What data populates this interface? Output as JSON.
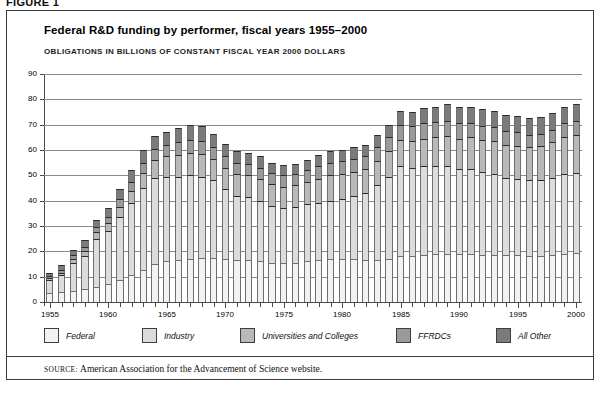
{
  "figure": {
    "label": "FIGURE 1"
  },
  "header": {
    "title": "Federal R&D funding by performer, fiscal years 1955–2000",
    "subtitle": "OBLIGATIONS IN BILLIONS OF CONSTANT FISCAL YEAR 2000 DOLLARS"
  },
  "source": {
    "prefix": "SOURCE:",
    "text": "American Association for the Advancement of Science website."
  },
  "legend": {
    "position": "bottom",
    "items": [
      {
        "label": "Federal",
        "color": "#f2f2f0"
      },
      {
        "label": "Industry",
        "color": "#dcdcda"
      },
      {
        "label": "Universities and Colleges",
        "color": "#b9b9b7"
      },
      {
        "label": "FFRDCs",
        "color": "#9a9a98"
      },
      {
        "label": "All Other",
        "color": "#7b7b79"
      }
    ]
  },
  "chart_data": {
    "type": "bar",
    "stacked": true,
    "title": "Federal R&D funding by performer, fiscal years 1955–2000",
    "subtitle": "OBLIGATIONS IN BILLIONS OF CONSTANT FISCAL YEAR 2000 DOLLARS",
    "xlabel": "",
    "ylabel": "",
    "ylim": [
      0,
      90
    ],
    "ytick_step": 10,
    "yticks": [
      0,
      10,
      20,
      30,
      40,
      50,
      60,
      70,
      80,
      90
    ],
    "grid": true,
    "xlim": [
      1955,
      2000
    ],
    "x_tick_labels": [
      1955,
      1960,
      1965,
      1970,
      1975,
      1980,
      1985,
      1990,
      1995,
      2000
    ],
    "categories": [
      1955,
      1956,
      1957,
      1958,
      1959,
      1960,
      1961,
      1962,
      1963,
      1964,
      1965,
      1966,
      1967,
      1968,
      1969,
      1970,
      1971,
      1972,
      1973,
      1974,
      1975,
      1976,
      1977,
      1978,
      1979,
      1980,
      1981,
      1982,
      1983,
      1984,
      1985,
      1986,
      1987,
      1988,
      1989,
      1990,
      1991,
      1992,
      1993,
      1994,
      1995,
      1996,
      1997,
      1998,
      1999,
      2000
    ],
    "series": [
      {
        "name": "Federal",
        "color": "#f2f2f0",
        "values": [
          3.5,
          4.0,
          4.5,
          5.0,
          6.0,
          7.0,
          8.5,
          10.5,
          12.5,
          15.0,
          16.0,
          16.5,
          17.0,
          17.5,
          17.5,
          17.0,
          16.5,
          16.5,
          16.0,
          15.5,
          15.5,
          15.5,
          16.0,
          16.5,
          17.0,
          17.0,
          17.0,
          16.5,
          16.5,
          17.0,
          18.0,
          18.0,
          18.5,
          19.0,
          19.0,
          19.0,
          19.0,
          18.5,
          18.5,
          18.5,
          18.5,
          18.0,
          18.0,
          18.5,
          19.0,
          19.5
        ]
      },
      {
        "name": "Industry",
        "color": "#dcdcda",
        "values": [
          5.0,
          6.5,
          11.0,
          13.0,
          19.0,
          21.0,
          25.0,
          28.5,
          32.5,
          34.0,
          33.5,
          33.0,
          33.0,
          32.0,
          30.5,
          27.5,
          25.5,
          25.0,
          24.0,
          22.5,
          21.5,
          22.0,
          22.5,
          22.5,
          23.0,
          23.5,
          25.0,
          26.5,
          29.5,
          32.5,
          35.5,
          35.0,
          35.0,
          34.5,
          34.5,
          33.5,
          33.5,
          33.0,
          32.0,
          30.5,
          30.0,
          30.0,
          30.0,
          30.5,
          31.5,
          31.5
        ]
      },
      {
        "name": "Universities and Colleges",
        "color": "#b9b9b7",
        "values": [
          0.8,
          1.0,
          1.5,
          2.0,
          2.5,
          3.0,
          4.0,
          5.0,
          6.0,
          7.0,
          8.0,
          8.5,
          9.0,
          9.0,
          8.5,
          8.5,
          8.5,
          8.5,
          8.5,
          8.5,
          8.5,
          8.5,
          9.0,
          9.5,
          10.0,
          10.0,
          9.5,
          9.5,
          9.5,
          10.0,
          10.5,
          10.5,
          11.0,
          11.5,
          12.0,
          12.0,
          12.5,
          12.5,
          13.0,
          13.0,
          13.0,
          13.0,
          13.5,
          14.0,
          14.5,
          15.0
        ]
      },
      {
        "name": "FFRDCs",
        "color": "#9a9a98",
        "values": [
          1.0,
          1.2,
          1.5,
          1.8,
          2.0,
          2.5,
          3.0,
          3.5,
          4.0,
          4.5,
          4.5,
          5.0,
          5.0,
          5.0,
          4.5,
          4.5,
          4.5,
          4.5,
          4.5,
          4.5,
          4.5,
          4.5,
          4.5,
          5.0,
          5.0,
          5.0,
          5.0,
          5.0,
          5.5,
          5.5,
          6.0,
          6.0,
          6.0,
          6.0,
          6.0,
          6.0,
          5.5,
          5.5,
          5.5,
          5.5,
          5.5,
          5.0,
          5.0,
          5.0,
          5.5,
          5.5
        ]
      },
      {
        "name": "All Other",
        "color": "#7b7b79",
        "values": [
          1.2,
          1.8,
          2.0,
          2.5,
          3.0,
          3.5,
          4.0,
          4.5,
          5.0,
          5.0,
          5.0,
          5.5,
          6.0,
          6.0,
          5.5,
          5.0,
          4.5,
          4.5,
          4.5,
          4.0,
          4.0,
          4.0,
          4.0,
          4.5,
          4.5,
          4.5,
          4.5,
          4.5,
          5.0,
          5.0,
          5.5,
          5.5,
          6.0,
          6.0,
          6.5,
          6.5,
          6.5,
          6.5,
          6.5,
          6.5,
          6.5,
          6.5,
          6.5,
          6.5,
          6.5,
          6.5
        ]
      }
    ],
    "totals": [
      11.5,
      14.5,
      20.5,
      24.3,
      32.5,
      37.0,
      44.5,
      52.0,
      60.0,
      65.5,
      67.0,
      68.5,
      70.0,
      69.5,
      66.5,
      62.5,
      59.5,
      59.0,
      57.5,
      55.0,
      54.0,
      54.5,
      56.0,
      58.0,
      59.5,
      60.0,
      61.0,
      62.0,
      66.0,
      70.0,
      75.5,
      75.0,
      76.5,
      77.0,
      78.0,
      77.0,
      77.0,
      76.0,
      75.5,
      74.0,
      73.5,
      72.5,
      73.0,
      74.5,
      77.0,
      78.0
    ]
  }
}
